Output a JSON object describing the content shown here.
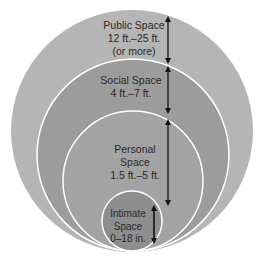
{
  "colors": {
    "public": "#b5b5b5",
    "social": "#9c9c9c",
    "personal": "#a3a3a3",
    "intimate": "#8e8e8e",
    "ring_stroke": "#ffffff",
    "arrow": "#111111",
    "text": "#2a2a2a"
  },
  "zones": [
    {
      "name": "Public Space",
      "line1": "Public Space",
      "line2": "12 ft.–25 ft.",
      "line3": "(or more)"
    },
    {
      "name": "Social Space",
      "line1": "Social Space",
      "line2": "4 ft.–7 ft."
    },
    {
      "name": "Personal Space",
      "line1": "Personal",
      "line2": "Space",
      "line3": "1.5 ft.–5 ft."
    },
    {
      "name": "Intimate Space",
      "line1": "Intimate",
      "line2": "Space",
      "line3": "0–18 in."
    }
  ]
}
